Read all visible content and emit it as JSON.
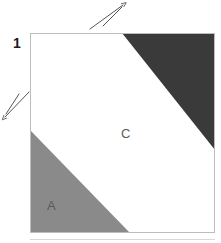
{
  "figure": {
    "background_color": "#ffffff",
    "canvas": {
      "width": 221,
      "height": 243
    }
  },
  "square": {
    "name": "unit-square",
    "left": 30,
    "top": 33,
    "right": 215,
    "bottom": 233,
    "outline_color": "#bdbdbd",
    "fill_color": "#ffffff"
  },
  "regions": [
    {
      "id": "region-a",
      "label": "A",
      "color": "#8a8a8a",
      "label_x": 47,
      "label_y": 210,
      "points": "30,130 30,233 130,233",
      "description": "light gray triangle at lower-left"
    },
    {
      "id": "region-b",
      "label": "",
      "color": "#3a3a3a",
      "label_x": 0,
      "label_y": 0,
      "points": "122,33 215,33 215,150",
      "description": "dark gray triangle at upper-right"
    },
    {
      "id": "region-c",
      "label": "C",
      "color": "#ffffff",
      "label_x": 121,
      "label_y": 138,
      "points": "30,33 122,33 215,150 215,233 130,233 30,130",
      "description": "white band across the middle"
    }
  ],
  "dimensions": [
    {
      "id": "dimension-1",
      "text": "1",
      "x": 13,
      "y": 48,
      "color": "#1c1c1c"
    }
  ],
  "arrows": [
    {
      "id": "arrow-top",
      "direction": "northeast",
      "x1": 90,
      "y1": 29,
      "x2": 123,
      "y2": 5,
      "color": "#555555"
    },
    {
      "id": "arrow-left",
      "direction": "southwest",
      "x1": 29,
      "y1": 92,
      "x2": 4,
      "y2": 118,
      "color": "#555555"
    }
  ],
  "baseline": {
    "id": "baseline-faint",
    "x1": 30,
    "y1": 239,
    "x2": 215,
    "y2": 239,
    "color": "#d8d8d8"
  }
}
